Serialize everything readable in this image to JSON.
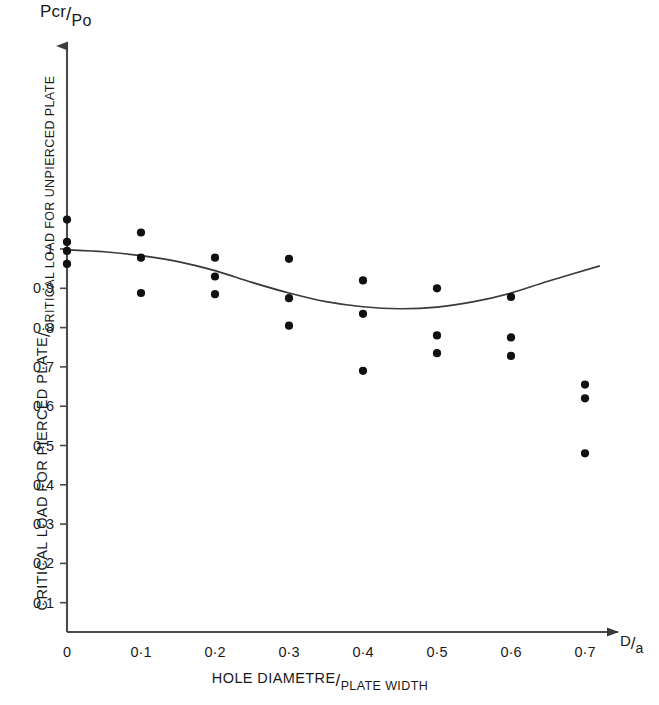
{
  "chart_data": {
    "type": "scatter",
    "title": "",
    "xlabel": "HOLE DIAMETRE/PLATE WIDTH",
    "xlabel_numerator": "HOLE DIAMETRE",
    "xlabel_denominator": "PLATE WIDTH",
    "xsymbol_numerator": "D",
    "xsymbol_denominator": "a",
    "ylabel": "CRITICAL LOAD FOR PIERCED PLATE/CRITICAL LOAD FOR UNPIERCED PLATE",
    "ylabel_numerator": "CRITICAL LOAD FOR PIERCED PLATE",
    "ylabel_denominator": "CRITICAL LOAD FOR UNPIERCED PLATE",
    "ysymbol_numerator": "Pcr",
    "ysymbol_denominator": "Po",
    "slash": "/",
    "xlim": [
      0,
      0.74
    ],
    "ylim": [
      0,
      1.13
    ],
    "grid": false,
    "legend": null,
    "xticks": [
      0,
      0.1,
      0.2,
      0.3,
      0.4,
      0.5,
      0.6,
      0.7
    ],
    "xtick_labels": [
      "0",
      "0·1",
      "0·2",
      "0·3",
      "0·4",
      "0·5",
      "0·6",
      "0·7"
    ],
    "yticks": [
      0.1,
      0.2,
      0.3,
      0.4,
      0.5,
      0.6,
      0.7,
      0.8,
      0.9,
      1.0
    ],
    "ytick_labels": [
      "0·1",
      "0·2",
      "0·3",
      "0·4",
      "0·5",
      "0·6",
      "0·7",
      "0·8",
      "0·9",
      "1"
    ],
    "marker_color": "#111111",
    "curve_color": "#3a3a3a",
    "axis_color": "#4a4a4a",
    "series": [
      {
        "name": "experimental points",
        "marker": "filled-circle",
        "points": [
          {
            "x": 0.0,
            "y": 1.075
          },
          {
            "x": 0.0,
            "y": 1.018
          },
          {
            "x": 0.0,
            "y": 0.995
          },
          {
            "x": 0.0,
            "y": 0.962
          },
          {
            "x": 0.1,
            "y": 1.042
          },
          {
            "x": 0.1,
            "y": 0.978
          },
          {
            "x": 0.1,
            "y": 0.888
          },
          {
            "x": 0.2,
            "y": 0.978
          },
          {
            "x": 0.2,
            "y": 0.93
          },
          {
            "x": 0.2,
            "y": 0.885
          },
          {
            "x": 0.3,
            "y": 0.975
          },
          {
            "x": 0.3,
            "y": 0.875
          },
          {
            "x": 0.3,
            "y": 0.805
          },
          {
            "x": 0.4,
            "y": 0.92
          },
          {
            "x": 0.4,
            "y": 0.835
          },
          {
            "x": 0.4,
            "y": 0.69
          },
          {
            "x": 0.5,
            "y": 0.9
          },
          {
            "x": 0.5,
            "y": 0.78
          },
          {
            "x": 0.5,
            "y": 0.735
          },
          {
            "x": 0.6,
            "y": 0.878
          },
          {
            "x": 0.6,
            "y": 0.775
          },
          {
            "x": 0.6,
            "y": 0.728
          },
          {
            "x": 0.7,
            "y": 0.655
          },
          {
            "x": 0.7,
            "y": 0.62
          },
          {
            "x": 0.7,
            "y": 0.48
          }
        ]
      },
      {
        "name": "fitted curve",
        "marker": "none",
        "points": [
          {
            "x": 0.0,
            "y": 0.998
          },
          {
            "x": 0.05,
            "y": 0.993
          },
          {
            "x": 0.1,
            "y": 0.983
          },
          {
            "x": 0.15,
            "y": 0.968
          },
          {
            "x": 0.2,
            "y": 0.945
          },
          {
            "x": 0.25,
            "y": 0.915
          },
          {
            "x": 0.3,
            "y": 0.888
          },
          {
            "x": 0.35,
            "y": 0.866
          },
          {
            "x": 0.4,
            "y": 0.853
          },
          {
            "x": 0.45,
            "y": 0.848
          },
          {
            "x": 0.5,
            "y": 0.852
          },
          {
            "x": 0.55,
            "y": 0.866
          },
          {
            "x": 0.6,
            "y": 0.888
          },
          {
            "x": 0.65,
            "y": 0.918
          },
          {
            "x": 0.72,
            "y": 0.957
          }
        ]
      }
    ]
  }
}
